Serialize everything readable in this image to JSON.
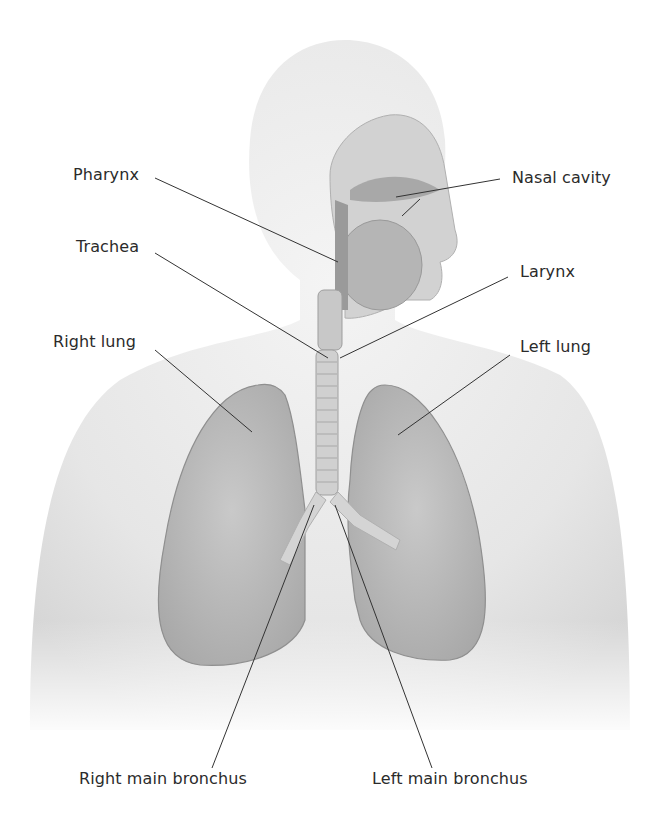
{
  "figure": {
    "labels": {
      "pharynx": "Pharynx",
      "trachea": "Trachea",
      "right_lung": "Right lung",
      "nasal_cavity": "Nasal cavity",
      "larynx": "Larynx",
      "left_lung": "Left lung",
      "right_main_bronchus": "Right main bronchus",
      "left_main_bronchus": "Left main bronchus"
    }
  }
}
